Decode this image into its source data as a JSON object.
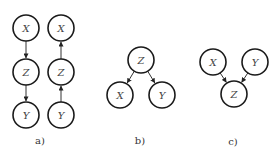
{
  "diagram": {
    "node_radius": 13,
    "panels": [
      {
        "label": "a)",
        "label_pos": [
          40,
          144
        ],
        "nodes": [
          {
            "id": "a1x",
            "text": "X",
            "x": 26,
            "y": 28
          },
          {
            "id": "a1z",
            "text": "Z",
            "x": 26,
            "y": 72
          },
          {
            "id": "a1y",
            "text": "Y",
            "x": 26,
            "y": 115
          },
          {
            "id": "a2x",
            "text": "X",
            "x": 61,
            "y": 28
          },
          {
            "id": "a2z",
            "text": "Z",
            "x": 61,
            "y": 72
          },
          {
            "id": "a2y",
            "text": "Y",
            "x": 61,
            "y": 115
          }
        ],
        "edges": [
          {
            "from": "a1x",
            "to": "a1z"
          },
          {
            "from": "a1z",
            "to": "a1y"
          },
          {
            "from": "a2z",
            "to": "a2x"
          },
          {
            "from": "a2y",
            "to": "a2z"
          }
        ]
      },
      {
        "label": "b)",
        "label_pos": [
          140,
          144
        ],
        "nodes": [
          {
            "id": "bz",
            "text": "Z",
            "x": 141,
            "y": 60
          },
          {
            "id": "bx",
            "text": "X",
            "x": 120,
            "y": 95
          },
          {
            "id": "by",
            "text": "Y",
            "x": 162,
            "y": 95
          }
        ],
        "edges": [
          {
            "from": "bz",
            "to": "bx"
          },
          {
            "from": "bz",
            "to": "by"
          }
        ]
      },
      {
        "label": "c)",
        "label_pos": [
          233,
          145
        ],
        "nodes": [
          {
            "id": "cx",
            "text": "X",
            "x": 213,
            "y": 62
          },
          {
            "id": "cy",
            "text": "Y",
            "x": 255,
            "y": 62
          },
          {
            "id": "cz",
            "text": "Z",
            "x": 234,
            "y": 94
          }
        ],
        "edges": [
          {
            "from": "cx",
            "to": "cz"
          },
          {
            "from": "cy",
            "to": "cz"
          }
        ]
      }
    ]
  }
}
